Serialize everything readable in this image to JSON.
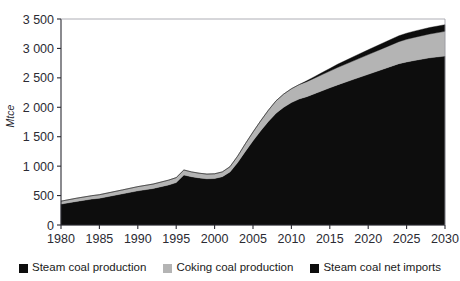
{
  "figure": {
    "title": "",
    "title_visible": false
  },
  "colors": {
    "steam_coal_production": "#0d0d0d",
    "coking_coal_production": "#b4b4b4",
    "steam_coal_net_imports": "#0d0d0d",
    "axis": "#2b2b33",
    "background": "#ffffff"
  },
  "legend": {
    "items": [
      {
        "label": "Steam coal production",
        "color": "#0d0d0d"
      },
      {
        "label": "Coking coal production",
        "color": "#b4b4b4"
      },
      {
        "label": "Steam coal net imports",
        "color": "#0d0d0d"
      }
    ]
  },
  "axes": {
    "y_title": "Mtce",
    "y_ticks": [
      "0",
      "500",
      "1 000",
      "1 500",
      "2 000",
      "2 500",
      "3 000",
      "3 500"
    ],
    "x_ticks": [
      "1980",
      "1985",
      "1990",
      "1995",
      "2000",
      "2005",
      "2010",
      "2015",
      "2020",
      "2025",
      "2030"
    ]
  },
  "chart_data": {
    "type": "area",
    "stacked": true,
    "title": "",
    "xlabel": "",
    "ylabel": "Mtce",
    "xlim": [
      1980,
      2030
    ],
    "ylim": [
      0,
      3500
    ],
    "ytick_values": [
      0,
      500,
      1000,
      1500,
      2000,
      2500,
      3000,
      3500
    ],
    "xtick_values": [
      1980,
      1985,
      1990,
      1995,
      2000,
      2005,
      2010,
      2015,
      2020,
      2025,
      2030
    ],
    "grid": false,
    "legend_position": "bottom",
    "x": [
      1980,
      1982,
      1984,
      1985,
      1986,
      1988,
      1990,
      1992,
      1994,
      1995,
      1996,
      1997,
      1998,
      1999,
      2000,
      2001,
      2002,
      2003,
      2004,
      2005,
      2006,
      2007,
      2008,
      2009,
      2010,
      2011,
      2012,
      2013,
      2014,
      2015,
      2016,
      2018,
      2020,
      2022,
      2024,
      2025,
      2026,
      2028,
      2030
    ],
    "series": [
      {
        "name": "Steam coal production",
        "color": "#0d0d0d",
        "values": [
          355,
          400,
          440,
          455,
          480,
          530,
          580,
          620,
          680,
          720,
          850,
          820,
          800,
          785,
          790,
          820,
          900,
          1060,
          1250,
          1430,
          1600,
          1760,
          1900,
          2000,
          2080,
          2140,
          2180,
          2230,
          2280,
          2330,
          2380,
          2470,
          2560,
          2650,
          2740,
          2770,
          2795,
          2840,
          2870
        ]
      },
      {
        "name": "Coking coal production",
        "color": "#b4b4b4",
        "values": [
          50,
          55,
          58,
          60,
          62,
          66,
          72,
          76,
          82,
          85,
          85,
          82,
          80,
          80,
          80,
          82,
          90,
          110,
          130,
          150,
          170,
          190,
          210,
          225,
          235,
          245,
          255,
          265,
          275,
          285,
          295,
          315,
          335,
          355,
          375,
          385,
          392,
          405,
          420
        ]
      },
      {
        "name": "Steam coal net imports",
        "color": "#0d0d0d",
        "values": [
          0,
          0,
          0,
          0,
          0,
          0,
          0,
          0,
          0,
          0,
          0,
          0,
          0,
          0,
          0,
          0,
          0,
          0,
          0,
          0,
          0,
          0,
          0,
          0,
          0,
          0,
          15,
          25,
          35,
          45,
          55,
          70,
          82,
          92,
          100,
          103,
          106,
          110,
          113
        ]
      }
    ],
    "totals": [
      405,
      455,
      498,
      515,
      542,
      596,
      652,
      696,
      762,
      805,
      935,
      902,
      880,
      865,
      870,
      902,
      990,
      1170,
      1380,
      1580,
      1770,
      1950,
      2110,
      2225,
      2315,
      2385,
      2450,
      2520,
      2590,
      2660,
      2730,
      2855,
      2977,
      3097,
      3215,
      3258,
      3293,
      3355,
      3403
    ]
  }
}
